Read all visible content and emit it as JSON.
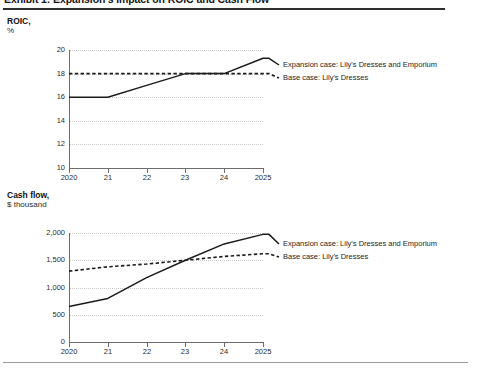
{
  "exhibit": {
    "title": "Exhibit 1: Expansion's Impact on ROIC and Cash Flow"
  },
  "charts": [
    {
      "unit_title": "ROIC,",
      "unit_subtitle": "%",
      "legend": [
        {
          "label": "Expansion case: Lily's Dresses and Emporium",
          "style": "solid"
        },
        {
          "label": "Base case: Lily's Dresses",
          "style": "dashed"
        }
      ]
    },
    {
      "unit_title": "Cash flow,",
      "unit_subtitle": "$ thousand",
      "legend": [
        {
          "label": "Expansion case: Lily's Dresses and Emporium",
          "style": "solid"
        },
        {
          "label": "Base case: Lily's Dresses",
          "style": "dashed"
        }
      ]
    }
  ],
  "chart_data": [
    {
      "type": "line",
      "title": "ROIC, %",
      "xlabel": "",
      "ylabel": "%",
      "x": [
        2020,
        2021,
        2022,
        2023,
        2024,
        2025
      ],
      "xtick_labels": [
        "2020",
        "21",
        "22",
        "23",
        "24",
        "2025"
      ],
      "ytick_labels": [
        "10",
        "12",
        "14",
        "16",
        "18",
        "20"
      ],
      "ylim": [
        10,
        20
      ],
      "yticks": [
        10,
        12,
        14,
        16,
        18,
        20
      ],
      "grid": true,
      "legend_position": "right",
      "series": [
        {
          "name": "Expansion case: Lily's Dresses and Emporium",
          "style": "solid",
          "values": [
            16.0,
            16.0,
            17.0,
            18.0,
            18.0,
            19.3
          ]
        },
        {
          "name": "Base case: Lily's Dresses",
          "style": "dashed",
          "values": [
            18.0,
            18.0,
            18.0,
            18.0,
            18.0,
            18.0
          ]
        }
      ]
    },
    {
      "type": "line",
      "title": "Cash flow, $ thousand",
      "xlabel": "",
      "ylabel": "$ thousand",
      "x": [
        2020,
        2021,
        2022,
        2023,
        2024,
        2025
      ],
      "xtick_labels": [
        "2020",
        "21",
        "22",
        "23",
        "24",
        "2025"
      ],
      "ytick_labels": [
        "0",
        "500",
        "1,000",
        "1,500",
        "2,000"
      ],
      "ylim": [
        0,
        2000
      ],
      "yticks": [
        0,
        500,
        1000,
        1500,
        2000
      ],
      "grid": true,
      "legend_position": "right",
      "series": [
        {
          "name": "Expansion case: Lily's Dresses and Emporium",
          "style": "solid",
          "values": [
            650,
            800,
            1180,
            1500,
            1800,
            1975
          ]
        },
        {
          "name": "Base case: Lily's Dresses",
          "style": "dashed",
          "values": [
            1300,
            1380,
            1430,
            1500,
            1570,
            1620
          ]
        }
      ]
    }
  ],
  "colors": {
    "line": "#1a1a1a",
    "grid": "#c9c9c9",
    "axis": "#6d6d6d",
    "rule": "#2e2e2e"
  }
}
